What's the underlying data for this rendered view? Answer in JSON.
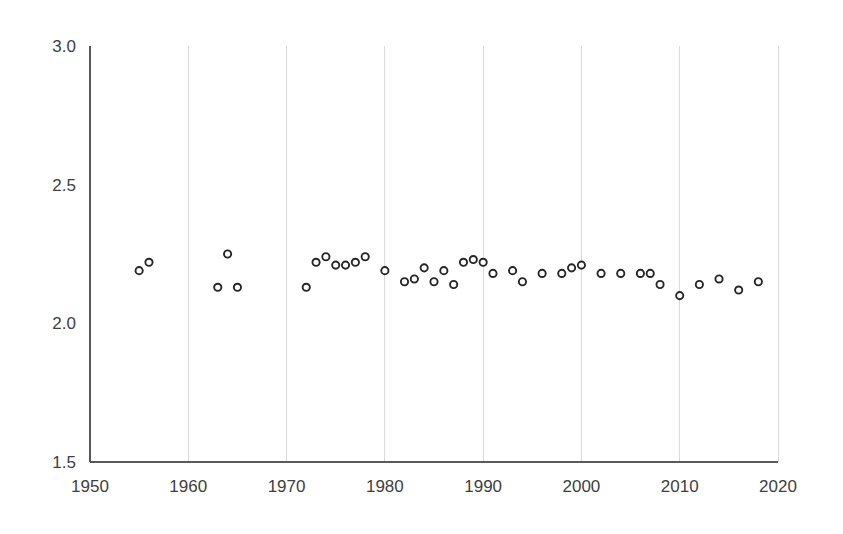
{
  "chart_data": {
    "type": "scatter",
    "title": "",
    "subtitle": "",
    "xlabel": "",
    "ylabel": "",
    "xlim": [
      1950,
      2020
    ],
    "ylim": [
      1.5,
      3.0
    ],
    "xticks": [
      1950,
      1960,
      1970,
      1980,
      1990,
      2000,
      2010,
      2020
    ],
    "yticks": [
      1.5,
      2.0,
      2.5,
      3.0
    ],
    "xtick_labels": [
      "1950",
      "1960",
      "1970",
      "1980",
      "1990",
      "2000",
      "2010",
      "2020"
    ],
    "ytick_labels": [
      "1.5",
      "2.0",
      "2.5",
      "3.0"
    ],
    "grid": "vertical-only",
    "legend": "none",
    "annotations": [],
    "marker": {
      "shape": "circle-open",
      "fill_color": "#ffffff",
      "edge_color": "#262626",
      "size_px": 9
    },
    "series": [
      {
        "name": "series-1",
        "x": [
          1955,
          1956,
          1963,
          1964,
          1965,
          1972,
          1973,
          1974,
          1975,
          1976,
          1977,
          1978,
          1980,
          1982,
          1983,
          1984,
          1985,
          1986,
          1987,
          1988,
          1989,
          1990,
          1991,
          1993,
          1994,
          1996,
          1998,
          1999,
          2000,
          2002,
          2004,
          2006,
          2007,
          2008,
          2010,
          2012,
          2014,
          2016,
          2018
        ],
        "y": [
          2.19,
          2.22,
          2.13,
          2.25,
          2.13,
          2.13,
          2.22,
          2.24,
          2.21,
          2.21,
          2.22,
          2.24,
          2.19,
          2.15,
          2.16,
          2.2,
          2.15,
          2.19,
          2.14,
          2.22,
          2.23,
          2.22,
          2.18,
          2.19,
          2.15,
          2.18,
          2.18,
          2.2,
          2.21,
          2.18,
          2.18,
          2.18,
          2.18,
          2.14,
          2.1,
          2.14,
          2.16,
          2.12,
          2.15
        ]
      }
    ]
  }
}
